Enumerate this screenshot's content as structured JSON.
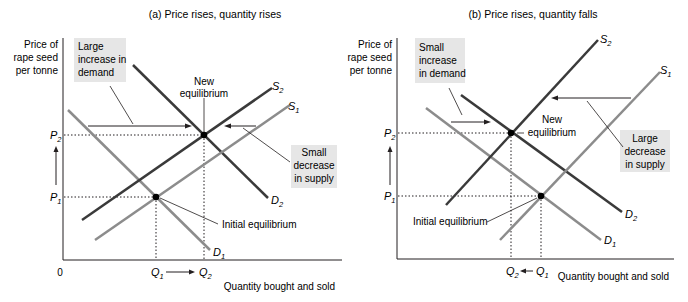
{
  "panels": [
    {
      "id": "a",
      "title": "(a) Price rises, quantity rises",
      "y_axis_label": [
        "Price of",
        "rape seed",
        "per tonne"
      ],
      "x_axis_label": "Quantity bought and sold",
      "origin_label": "0",
      "price_labels": {
        "p1": "P",
        "p1_sub": "1",
        "p2": "P",
        "p2_sub": "2"
      },
      "quantity_labels": {
        "q1": "Q",
        "q1_sub": "1",
        "q2": "Q",
        "q2_sub": "2"
      },
      "curves": {
        "d1": {
          "name": "D",
          "sub": "1"
        },
        "d2": {
          "name": "D",
          "sub": "2"
        },
        "s1": {
          "name": "S",
          "sub": "1"
        },
        "s2": {
          "name": "S",
          "sub": "2"
        }
      },
      "boxes": {
        "demand": [
          "Large",
          "increase in",
          "demand"
        ],
        "supply": [
          "Small",
          "decrease",
          "in supply"
        ]
      },
      "annotations": {
        "new_eq": [
          "New",
          "equilibrium"
        ],
        "initial_eq": "Initial equilibrium"
      }
    },
    {
      "id": "b",
      "title": "(b) Price rises, quantity falls",
      "y_axis_label": [
        "Price of",
        "rape seed",
        "per tonne"
      ],
      "x_axis_label": "Quantity bought and sold",
      "price_labels": {
        "p1": "P",
        "p1_sub": "1",
        "p2": "P",
        "p2_sub": "2"
      },
      "quantity_labels": {
        "q1": "Q",
        "q1_sub": "1",
        "q2": "Q",
        "q2_sub": "2"
      },
      "curves": {
        "d1": {
          "name": "D",
          "sub": "1"
        },
        "d2": {
          "name": "D",
          "sub": "2"
        },
        "s1": {
          "name": "S",
          "sub": "1"
        },
        "s2": {
          "name": "S",
          "sub": "2"
        }
      },
      "boxes": {
        "demand": [
          "Small",
          "increase",
          " in demand"
        ],
        "supply": [
          "Large",
          "decrease",
          "in supply"
        ]
      },
      "annotations": {
        "new_eq": [
          "New",
          "equilibrium"
        ],
        "initial_eq": "Initial equilibrium"
      }
    }
  ],
  "colors": {
    "dark_curve": "#3a3a3a",
    "light_curve": "#8c8c8c",
    "box_fill": "#e6e6e6",
    "axis": "#231f20"
  }
}
